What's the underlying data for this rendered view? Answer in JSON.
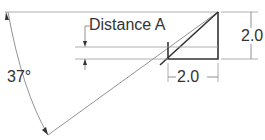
{
  "labels": {
    "distance": "Distance A",
    "angle": "37°",
    "height": "2.0",
    "width": "2.0"
  },
  "colors": {
    "line": "#333333",
    "thin": "#777777"
  }
}
